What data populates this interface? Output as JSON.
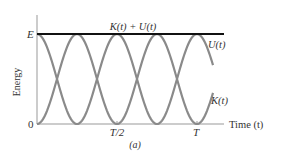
{
  "chart_data": {
    "type": "line",
    "title": "",
    "xlabel": "Time (t)",
    "ylabel": "Energy",
    "x_ticks": [
      "0",
      "T/2",
      "T"
    ],
    "y_ticks": [
      "0",
      "E"
    ],
    "xlim": [
      0,
      1.1
    ],
    "ylim": [
      0,
      1.2
    ],
    "grid": false,
    "legend": "inline labels",
    "series": [
      {
        "name": "K(t) + U(t)",
        "description": "constant total energy E",
        "x": [
          0,
          1.1
        ],
        "values": [
          1,
          1
        ],
        "color": "#111111"
      },
      {
        "name": "U(t)",
        "description": "E cos^2(2πt/T), starts at E",
        "x": [
          0,
          0.25,
          0.5,
          0.75,
          1.0
        ],
        "values": [
          1,
          0,
          1,
          0,
          1
        ],
        "color": "#8a8a8a"
      },
      {
        "name": "K(t)",
        "description": "E sin^2(2πt/T), starts at 0",
        "x": [
          0,
          0.25,
          0.5,
          0.75,
          1.0
        ],
        "values": [
          0,
          1,
          0,
          1,
          0
        ],
        "color": "#8a8a8a"
      }
    ],
    "annotations": [
      "(a)"
    ]
  },
  "labels": {
    "y_axis": "Energy",
    "x_axis": "Time (t)",
    "e_tick": "E",
    "zero_tick": "0",
    "half_period": "T/2",
    "period": "T",
    "total": "K(t) + U(t)",
    "potential": "U(t)",
    "kinetic": "K(t)",
    "panel": "(a)"
  }
}
